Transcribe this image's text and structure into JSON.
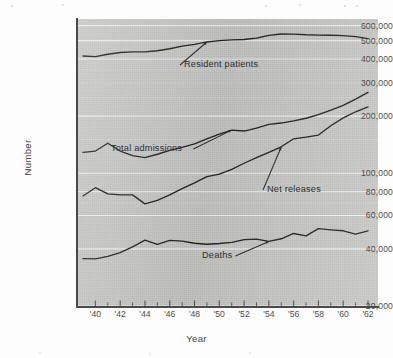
{
  "chart_data": {
    "type": "line",
    "title": "",
    "xlabel": "Year",
    "ylabel": "Number",
    "yscale": "log",
    "ylim": [
      20000,
      650000
    ],
    "grid": true,
    "legend_position": "inline-annotations",
    "y_ticks": [
      {
        "value": 600000,
        "label": "600,000",
        "major": true
      },
      {
        "value": 500000,
        "label": "500,000",
        "major": true
      },
      {
        "value": 400000,
        "label": "400,000",
        "major": true
      },
      {
        "value": 300000,
        "label": "300,000",
        "major": true
      },
      {
        "value": 200000,
        "label": "200,000",
        "major": true
      },
      {
        "value": 100000,
        "label": "100,000",
        "major": true
      },
      {
        "value": 80000,
        "label": "80,000",
        "major": true
      },
      {
        "value": 60000,
        "label": "60,000",
        "major": true
      },
      {
        "value": 40000,
        "label": "40,000",
        "major": true
      },
      {
        "value": 20000,
        "label": "20,000",
        "major": true
      }
    ],
    "x_tick_labels": [
      "'40",
      "'42",
      "'44",
      "'46",
      "'48",
      "'50",
      "'52",
      "'54",
      "'56",
      "'58",
      "'60",
      "'62"
    ],
    "x": [
      1939,
      1940,
      1941,
      1942,
      1943,
      1944,
      1945,
      1946,
      1947,
      1948,
      1949,
      1950,
      1951,
      1952,
      1953,
      1954,
      1955,
      1956,
      1957,
      1958,
      1959,
      1960,
      1961,
      1962
    ],
    "series": [
      {
        "name": "Resident patients",
        "values": [
          415000,
          412000,
          424000,
          433000,
          436000,
          436000,
          442000,
          453000,
          468000,
          478000,
          492000,
          500000,
          505000,
          507000,
          515000,
          533000,
          542000,
          541000,
          537000,
          535000,
          534000,
          531000,
          525000,
          512000
        ]
      },
      {
        "name": "Total admissions",
        "values": [
          129000,
          131000,
          144000,
          131000,
          124000,
          121000,
          126000,
          132000,
          137000,
          143000,
          152000,
          161000,
          169000,
          167000,
          173000,
          181000,
          184000,
          189000,
          195000,
          204000,
          215000,
          228000,
          246000,
          267000
        ]
      },
      {
        "name": "Net releases",
        "values": [
          76000,
          84000,
          78000,
          77000,
          77000,
          69000,
          72000,
          77000,
          83000,
          89000,
          96000,
          99000,
          105000,
          113000,
          121000,
          129000,
          138000,
          152000,
          155000,
          159000,
          178000,
          196000,
          211000,
          224000
        ]
      },
      {
        "name": "Deaths",
        "values": [
          35500,
          35400,
          36500,
          38200,
          41000,
          44500,
          42200,
          44300,
          43900,
          42800,
          42300,
          42700,
          43300,
          44700,
          45000,
          43800,
          45200,
          48200,
          46800,
          51100,
          50400,
          49800,
          47800,
          49800
        ]
      }
    ],
    "annotations": [
      {
        "label": "Resident patients",
        "series": "Resident patients"
      },
      {
        "label": "Total admissions",
        "series": "Total admissions"
      },
      {
        "label": "Net releases",
        "series": "Net releases"
      },
      {
        "label": "Deaths",
        "series": "Deaths"
      }
    ]
  },
  "colors": {
    "plot_background": "#c9c9c7",
    "page_background": "#fdfdfd",
    "line": "#1f1f1f",
    "gridline": "#f2f2f0",
    "axis": "#4a4a4a",
    "text": "#454545"
  }
}
